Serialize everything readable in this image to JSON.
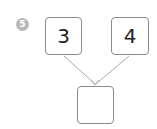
{
  "problem": {
    "number": "5",
    "top_boxes": [
      {
        "value": "3"
      },
      {
        "value": "4"
      }
    ],
    "result_box": {
      "value": ""
    },
    "colors": {
      "badge": "#b8b8b8",
      "border": "#8a8a8a",
      "arrow": "#aaaaaa"
    }
  }
}
